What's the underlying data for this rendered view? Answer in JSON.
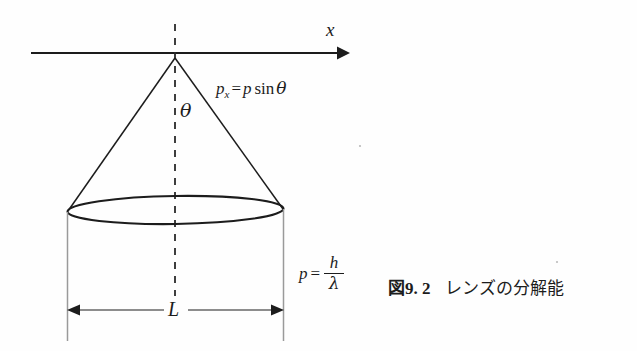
{
  "figure": {
    "caption_figure_word": "図",
    "caption_number": "9. 2",
    "caption_text": "レンズの分解能",
    "background_color": "#fefefe",
    "ink_color": "#1c1c1c"
  },
  "labels": {
    "axis_x": "x",
    "angle_theta": "θ",
    "momentum_x_lhs": "p",
    "momentum_x_sub": "x",
    "momentum_x_eq": "=",
    "momentum_x_p": "p",
    "momentum_x_fn": "sin",
    "momentum_x_theta": "θ",
    "aperture_width": "L",
    "momentum_lhs": "p",
    "momentum_eq": "=",
    "momentum_numerator": "h",
    "momentum_denominator": "λ"
  },
  "geometry": {
    "apex_x": 175,
    "apex_y": 58,
    "axis_start_x": 31,
    "axis_end_x": 345,
    "axis_y": 53,
    "ellipse_cx": 175,
    "ellipse_cy": 210,
    "ellipse_rx": 108,
    "ellipse_ry": 14,
    "dashed_top_y": 24,
    "dashed_bottom_y": 296,
    "cyl_left_x": 67,
    "cyl_right_x": 283,
    "cyl_bottom_y": 341,
    "dim_line_y": 310
  }
}
